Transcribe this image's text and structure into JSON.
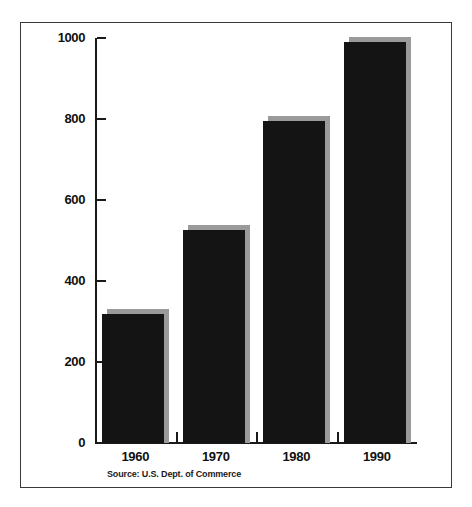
{
  "figure": {
    "background_color": "#ffffff",
    "frame_border_color": "#3a3a3a"
  },
  "chart_data": {
    "type": "bar",
    "title": "",
    "subtitle": "",
    "xlabel": "",
    "ylabel": "",
    "categories": [
      "1960",
      "1970",
      "1980",
      "1990"
    ],
    "values": [
      318,
      526,
      795,
      990
    ],
    "series": [
      {
        "name": "",
        "values": [
          318,
          526,
          795,
          990
        ]
      }
    ],
    "ylim": [
      0,
      1000
    ],
    "ytick_labels": [
      "0",
      "200",
      "400",
      "600",
      "800",
      "1000"
    ],
    "ytick_values": [
      0,
      200,
      400,
      600,
      800,
      1000
    ],
    "xtick_labels": [
      "1960",
      "1970",
      "1980",
      "1990"
    ],
    "grid": false,
    "legend": false,
    "legend_position": "none",
    "bar_color": "#141414",
    "bar_shadow_color": "#9a9a9a",
    "axis_color": "#1a1a1a",
    "annotations": [
      "Source: U.S. Dept. of Commerce"
    ]
  },
  "source_note": {
    "text": "Source: U.S. Dept. of Commerce"
  }
}
